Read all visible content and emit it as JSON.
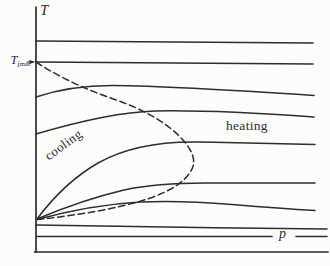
{
  "figure": {
    "labels": {
      "temperature_axis": "T",
      "pressure_axis": "p",
      "cooling_region": "cooling",
      "heating_region": "heating",
      "t_imax": {
        "base": "T",
        "sub": "i",
        "subsub": "max"
      }
    },
    "curves": {
      "solid_isenthalp_count": "8",
      "inversion_curve_style": "dashed"
    },
    "colors": {
      "ink": "#2d2d2d",
      "paper": "#fcfcfa"
    }
  }
}
